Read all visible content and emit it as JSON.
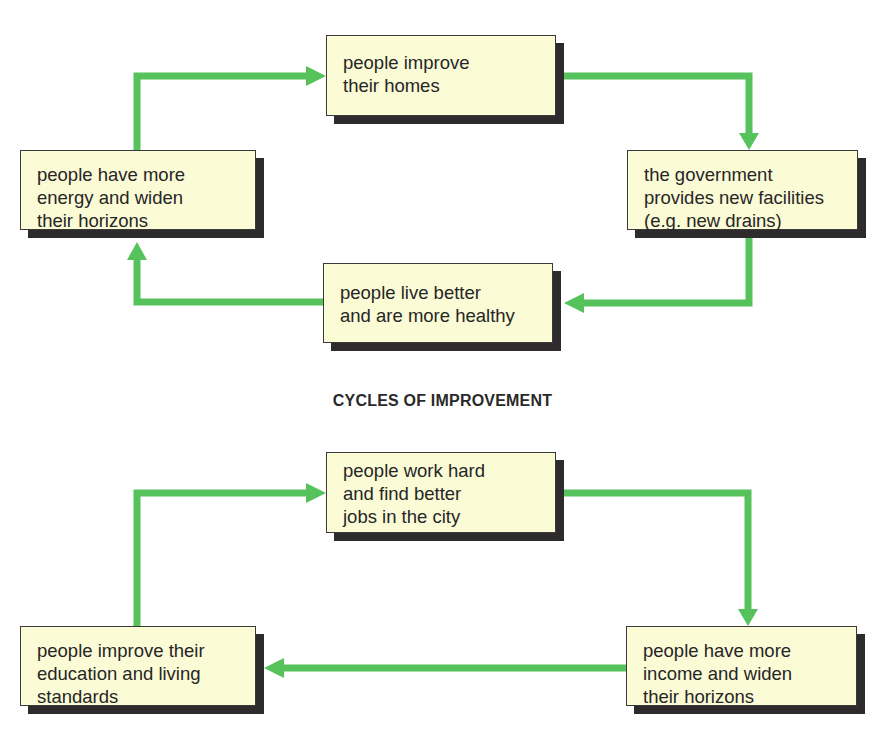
{
  "colors": {
    "arrow": "#56c25c",
    "box_fill": "#fbfbd6",
    "box_border": "#3a3a3a",
    "shadow": "#2e2b2d",
    "text": "#262626"
  },
  "title": "CYCLES OF IMPROVEMENT",
  "cycle1": {
    "nodes": [
      {
        "id": "improve-homes",
        "lines": [
          "people improve",
          "their homes"
        ]
      },
      {
        "id": "government-facilities",
        "lines": [
          "the government",
          "provides new facilities",
          "(e.g. new drains)"
        ]
      },
      {
        "id": "live-better",
        "lines": [
          "people live better",
          "and are more healthy"
        ]
      },
      {
        "id": "more-energy",
        "lines": [
          "people have more",
          "energy and widen",
          "their horizons"
        ]
      }
    ],
    "edges": [
      [
        "improve-homes",
        "government-facilities"
      ],
      [
        "government-facilities",
        "live-better"
      ],
      [
        "live-better",
        "more-energy"
      ],
      [
        "more-energy",
        "improve-homes"
      ]
    ]
  },
  "cycle2": {
    "nodes": [
      {
        "id": "work-hard",
        "lines": [
          "people work hard",
          "and find better",
          "jobs in the city"
        ]
      },
      {
        "id": "more-income",
        "lines": [
          "people have more",
          "income and widen",
          "their horizons"
        ]
      },
      {
        "id": "improve-education",
        "lines": [
          "people improve their",
          "education and living",
          "standards"
        ]
      }
    ],
    "edges": [
      [
        "work-hard",
        "more-income"
      ],
      [
        "more-income",
        "improve-education"
      ],
      [
        "improve-education",
        "work-hard"
      ]
    ]
  }
}
